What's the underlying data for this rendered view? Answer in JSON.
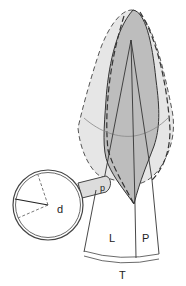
{
  "diagram": {
    "labels": {
      "d": "d",
      "p_small": "p",
      "L": "L",
      "P": "P",
      "T": "T"
    },
    "colors": {
      "outer_fill": "#e6e6e6",
      "inner_fill": "#bdbdbd",
      "stroke": "#333333",
      "background": "#ffffff"
    }
  }
}
